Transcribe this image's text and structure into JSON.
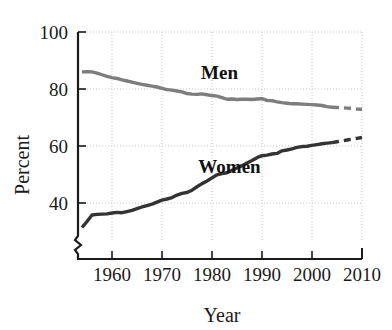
{
  "chart_data": {
    "type": "line",
    "title": "",
    "xlabel": "Year",
    "ylabel": "Percent",
    "xlim": [
      1953.2,
      2010
    ],
    "ylim": [
      30,
      100
    ],
    "y_axis_break": true,
    "grid": "dotted",
    "legend": "inline-labels",
    "xticks": [
      1960,
      1970,
      1980,
      1990,
      2000,
      2010
    ],
    "xtick_labels": [
      "1960",
      "1970",
      "1980",
      "1990",
      "2000",
      "2010"
    ],
    "yticks": [
      40,
      60,
      80,
      100
    ],
    "ytick_labels": [
      "40",
      "60",
      "80",
      "100"
    ],
    "series": [
      {
        "name": "Men",
        "label": "Men",
        "color": "#7d7d7d",
        "label_x": 1981.5,
        "label_y": 83.5,
        "x": [
          1954,
          1955,
          1956,
          1957,
          1958,
          1959,
          1960,
          1961,
          1962,
          1963,
          1964,
          1965,
          1966,
          1967,
          1968,
          1969,
          1970,
          1971,
          1972,
          1973,
          1974,
          1975,
          1976,
          1977,
          1978,
          1979,
          1980,
          1981,
          1982,
          1983,
          1984,
          1985,
          1986,
          1987,
          1988,
          1989,
          1990,
          1991,
          1992,
          1993,
          1994,
          1995,
          1996,
          1997,
          1998,
          1999,
          2000,
          2001,
          2002,
          2003,
          2004
        ],
        "values": [
          86.0,
          86.1,
          86.0,
          85.6,
          85.0,
          84.4,
          84.0,
          83.7,
          83.2,
          82.8,
          82.4,
          82.0,
          81.6,
          81.3,
          81.0,
          80.7,
          80.2,
          79.8,
          79.6,
          79.3,
          79.0,
          78.4,
          78.2,
          78.1,
          78.3,
          78.0,
          77.7,
          77.5,
          77.0,
          76.4,
          76.5,
          76.3,
          76.4,
          76.4,
          76.3,
          76.5,
          76.6,
          76.0,
          75.9,
          75.5,
          75.2,
          75.0,
          74.8,
          74.8,
          74.7,
          74.6,
          74.5,
          74.4,
          74.2,
          73.8,
          73.6
        ]
      },
      {
        "name": "Men projected",
        "label": "",
        "color": "#7d7d7d",
        "style": "dashed",
        "x": [
          2004,
          2005,
          2006,
          2007,
          2008,
          2009,
          2010
        ],
        "values": [
          73.6,
          73.5,
          73.4,
          73.3,
          73.2,
          73.0,
          72.9
        ]
      },
      {
        "name": "Women",
        "label": "Women",
        "color": "#333333",
        "label_x": 1983.5,
        "label_y": 50.5,
        "x": [
          1954,
          1955,
          1956,
          1957,
          1958,
          1959,
          1960,
          1961,
          1962,
          1963,
          1964,
          1965,
          1966,
          1967,
          1968,
          1969,
          1970,
          1971,
          1972,
          1973,
          1974,
          1975,
          1976,
          1977,
          1978,
          1979,
          1980,
          1981,
          1982,
          1983,
          1984,
          1985,
          1986,
          1987,
          1988,
          1989,
          1990,
          1991,
          1992,
          1993,
          1994,
          1995,
          1996,
          1997,
          1998,
          1999,
          2000,
          2001,
          2002,
          2003,
          2004
        ],
        "values": [
          31.4,
          33.5,
          35.8,
          36.0,
          36.1,
          36.2,
          36.5,
          36.7,
          36.6,
          37.0,
          37.4,
          38.0,
          38.6,
          39.1,
          39.6,
          40.3,
          41.0,
          41.4,
          41.9,
          42.8,
          43.4,
          43.7,
          44.5,
          45.7,
          46.8,
          47.7,
          48.8,
          49.9,
          50.3,
          50.6,
          51.5,
          52.3,
          53.1,
          54.0,
          54.9,
          55.9,
          56.6,
          56.8,
          57.2,
          57.4,
          58.3,
          58.6,
          59.0,
          59.5,
          59.8,
          59.9,
          60.2,
          60.5,
          60.8,
          61.0,
          61.2
        ]
      },
      {
        "name": "Women projected",
        "label": "",
        "color": "#333333",
        "style": "dashed",
        "x": [
          2004,
          2005,
          2006,
          2007,
          2008,
          2009,
          2010
        ],
        "values": [
          61.2,
          61.5,
          61.8,
          62.1,
          62.4,
          62.7,
          63.0
        ]
      }
    ]
  }
}
